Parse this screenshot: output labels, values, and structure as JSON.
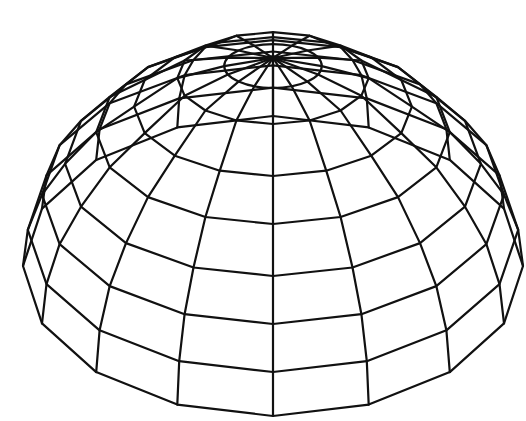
{
  "figure": {
    "title": "Wireframe hemisphere dome",
    "background": "#ffffff",
    "stroke_color": "#111111",
    "stroke_width": 2.2
  },
  "geometry": {
    "center_x": 273,
    "pole": [
      273,
      58
    ],
    "radius_x": 250,
    "meridian_count": 16,
    "latitude_step_deg": 11.25,
    "rings": [
      {
        "lat_deg": 0,
        "front_y": 416,
        "ry_ratio": 0.6
      },
      {
        "lat_deg": 11.25,
        "front_y": 372,
        "ry_ratio": 0.58
      },
      {
        "lat_deg": 22.5,
        "front_y": 324,
        "ry_ratio": 0.56
      },
      {
        "lat_deg": 33.75,
        "front_y": 276,
        "ry_ratio": 0.54
      },
      {
        "lat_deg": 45,
        "front_y": 224,
        "ry_ratio": 0.52
      },
      {
        "lat_deg": 56.25,
        "front_y": 176,
        "ry_ratio": 0.5
      },
      {
        "lat_deg": 67.5,
        "front_y": 124,
        "ry_ratio": 0.48
      },
      {
        "lat_deg": 78.75,
        "front_y": 88,
        "ry_ratio": 0.45,
        "smooth": true
      }
    ]
  }
}
